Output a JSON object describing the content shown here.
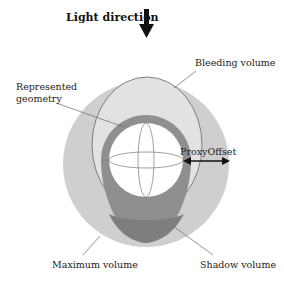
{
  "title": "Light direction",
  "labels": {
    "bleeding": "Bleeding volume",
    "represented_1": "Represented",
    "represented_2": "geometry",
    "proxy_offset": "ProxyOffset",
    "maximum": "Maximum volume",
    "shadow": "Shadow volume"
  },
  "colors": {
    "maximum_fill": "#cfcfcf",
    "bleeding_fill": "#e2e2e2",
    "shadow_fill": "#8f8f8f",
    "geometry_fill": "#ffffff",
    "lines": "#555555"
  }
}
